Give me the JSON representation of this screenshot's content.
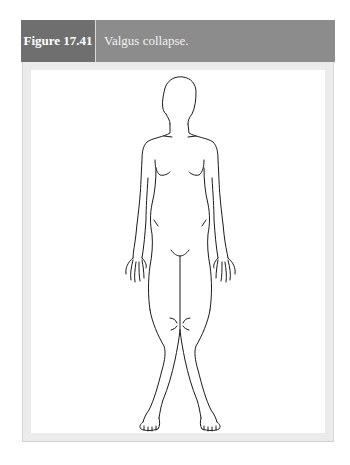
{
  "figure": {
    "number": "Figure 17.41",
    "caption": "Valgus collapse.",
    "illustration": "line-drawing-human-figure-knees-valgus",
    "colors": {
      "header_number_bg": "#6f6f6f",
      "header_caption_bg": "#8c8c8c",
      "frame_bg": "#ebebeb",
      "panel_bg": "#ffffff",
      "line": "#1a1a1a"
    }
  }
}
